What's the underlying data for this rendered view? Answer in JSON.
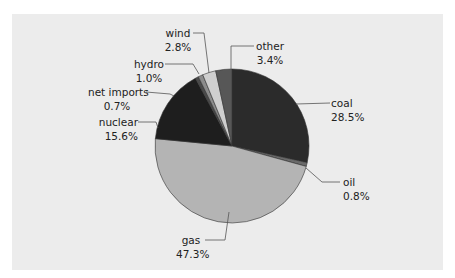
{
  "chart_data": {
    "type": "pie",
    "title": "",
    "start_angle_deg": 0,
    "direction": "clockwise",
    "slices": [
      {
        "label": "coal",
        "value": 28.5,
        "display": "28.5%",
        "color": "#2b2b2b"
      },
      {
        "label": "oil",
        "value": 0.8,
        "display": "0.8%",
        "color": "#6a6a6a"
      },
      {
        "label": "gas",
        "value": 47.3,
        "display": "47.3%",
        "color": "#b4b4b4"
      },
      {
        "label": "nuclear",
        "value": 15.6,
        "display": "15.6%",
        "color": "#1e1e1e"
      },
      {
        "label": "net imports",
        "value": 0.7,
        "display": "0.7%",
        "color": "#4a4a4a"
      },
      {
        "label": "hydro",
        "value": 1.0,
        "display": "1.0%",
        "color": "#8c8c8c"
      },
      {
        "label": "wind",
        "value": 2.8,
        "display": "2.8%",
        "color": "#cfcfcf"
      },
      {
        "label": "other",
        "value": 3.4,
        "display": "3.4%",
        "color": "#575757"
      }
    ],
    "legend": "none (callout labels)",
    "background_color": "#ececec"
  },
  "labels": {
    "coal": {
      "name": "coal",
      "pct": "28.5%"
    },
    "oil": {
      "name": "oil",
      "pct": "0.8%"
    },
    "gas": {
      "name": "gas",
      "pct": "47.3%"
    },
    "nuclear": {
      "name": "nuclear",
      "pct": "15.6%"
    },
    "net_imports": {
      "name": "net imports",
      "pct": "0.7%"
    },
    "hydro": {
      "name": "hydro",
      "pct": "1.0%"
    },
    "wind": {
      "name": "wind",
      "pct": "2.8%"
    },
    "other": {
      "name": "other",
      "pct": "3.4%"
    }
  }
}
